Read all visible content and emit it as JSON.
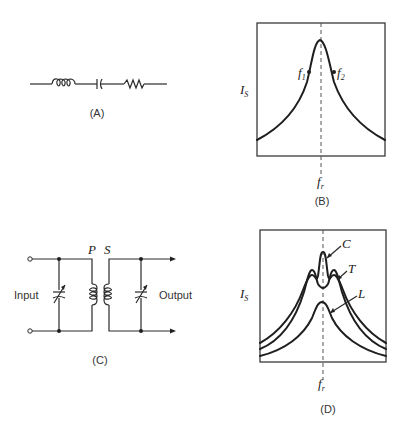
{
  "figure": {
    "panels": [
      {
        "id": "A",
        "caption": "(A)",
        "type": "series-circuit",
        "components": [
          "inductor",
          "capacitor",
          "resistor"
        ]
      },
      {
        "id": "B",
        "caption": "(B)",
        "type": "resonance-curve",
        "y_label": "I",
        "y_label_sub": "S",
        "x_marker": "f",
        "x_marker_sub": "r",
        "points": [
          {
            "label": "f",
            "sub": "1"
          },
          {
            "label": "f",
            "sub": "2"
          }
        ]
      },
      {
        "id": "C",
        "caption": "(C)",
        "type": "coupled-tuned-circuit",
        "input_label": "Input",
        "output_label": "Output",
        "primary_label": "P",
        "secondary_label": "S"
      },
      {
        "id": "D",
        "caption": "(D)",
        "type": "coupling-curves",
        "y_label": "I",
        "y_label_sub": "S",
        "x_marker": "f",
        "x_marker_sub": "r",
        "curve_labels": {
          "critical": "C",
          "tight": "T",
          "loose": "L"
        }
      }
    ]
  }
}
